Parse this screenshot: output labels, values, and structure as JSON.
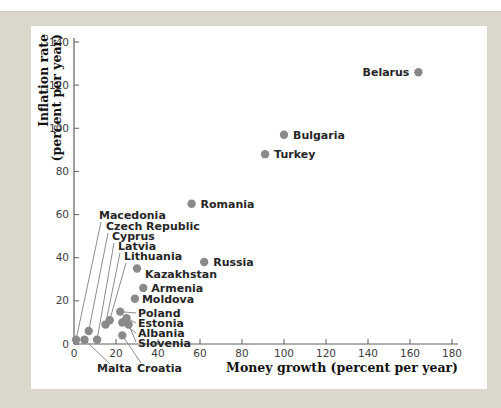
{
  "chart_data": {
    "type": "scatter",
    "title": "",
    "xlabel": "Money growth (percent per year)",
    "ylabel_lines": [
      "Inflation rate",
      "(percent per year)"
    ],
    "xlim": [
      0,
      180
    ],
    "ylim": [
      0,
      140
    ],
    "xticks": [
      0,
      20,
      40,
      60,
      80,
      100,
      120,
      140,
      160,
      180
    ],
    "yticks": [
      0,
      20,
      40,
      60,
      80,
      100,
      120,
      140
    ],
    "grid": false,
    "legend": "none",
    "points": [
      {
        "label": "Belarus",
        "x": 164,
        "y": 126
      },
      {
        "label": "Bulgaria",
        "x": 100,
        "y": 97
      },
      {
        "label": "Turkey",
        "x": 91,
        "y": 88
      },
      {
        "label": "Romania",
        "x": 56,
        "y": 65
      },
      {
        "label": "Russia",
        "x": 62,
        "y": 38
      },
      {
        "label": "Kazakhstan",
        "x": 30,
        "y": 35
      },
      {
        "label": "Armenia",
        "x": 33,
        "y": 26
      },
      {
        "label": "Moldova",
        "x": 29,
        "y": 21
      },
      {
        "label": "Poland",
        "x": 22,
        "y": 15
      },
      {
        "label": "Estonia",
        "x": 25,
        "y": 12
      },
      {
        "label": "Albania",
        "x": 23,
        "y": 10
      },
      {
        "label": "Slovenia",
        "x": 26,
        "y": 9
      },
      {
        "label": "Croatia",
        "x": 23,
        "y": 4
      },
      {
        "label": "Lithuania",
        "x": 17,
        "y": 11
      },
      {
        "label": "Latvia",
        "x": 15,
        "y": 9
      },
      {
        "label": "Cyprus",
        "x": 11,
        "y": 2
      },
      {
        "label": "Czech Republic",
        "x": 7,
        "y": 6
      },
      {
        "label": "Malta",
        "x": 5,
        "y": 2
      },
      {
        "label": "Macedonia",
        "x": 1,
        "y": 2
      }
    ]
  },
  "colors": {
    "backdrop": "#dbd8cb",
    "panel": "#ffffff",
    "axis": "#5f5f5f",
    "dot": "#8a8a8a",
    "leader_line": "#8c8c8c",
    "tick_text": "#3d3d3d",
    "label_text": "#262626"
  }
}
